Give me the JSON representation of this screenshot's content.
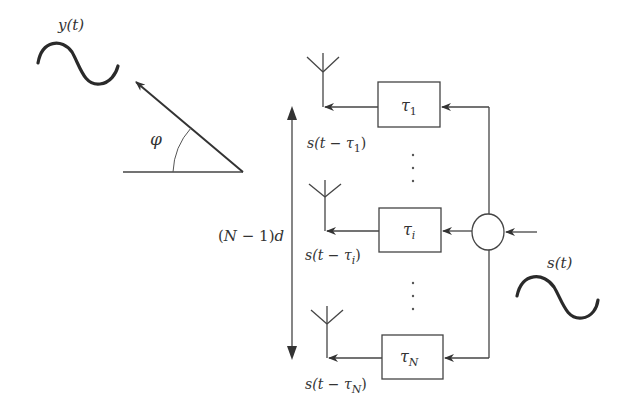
{
  "diagram": {
    "output_signal": {
      "label": "y(t)"
    },
    "input_signal": {
      "label": "s(t)"
    },
    "angle": {
      "label": "φ"
    },
    "array_span": {
      "label": "(N − 1)d"
    },
    "elements": [
      {
        "delay": "τ",
        "delay_sub": "1",
        "output": "s(t − τ",
        "output_sub": "1",
        "output_close": ")"
      },
      {
        "delay": "τ",
        "delay_sub": "i",
        "output": "s(t − τ",
        "output_sub": "i",
        "output_close": ")"
      },
      {
        "delay": "τ",
        "delay_sub": "N",
        "output": "s(t − τ",
        "output_sub": "N",
        "output_close": ")"
      }
    ],
    "ellipsis": "⋮",
    "colors": {
      "line": "#444444",
      "wave": "#2a2a2a",
      "text": "#333333"
    }
  }
}
